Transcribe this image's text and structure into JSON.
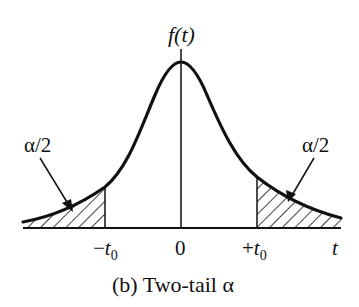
{
  "figure": {
    "y_axis_label": "f(t)",
    "x_axis_label": "t",
    "caption": "(b) Two-tail α",
    "ticks": {
      "neg_t0": {
        "sign": "−",
        "var": "t",
        "sub": "0"
      },
      "zero": "0",
      "pos_t0": {
        "sign": "+",
        "var": "t",
        "sub": "0"
      }
    },
    "annotations": {
      "left_tail": "α/2",
      "right_tail": "α/2"
    },
    "colors": {
      "ink": "#111111",
      "background": "#ffffff"
    }
  }
}
